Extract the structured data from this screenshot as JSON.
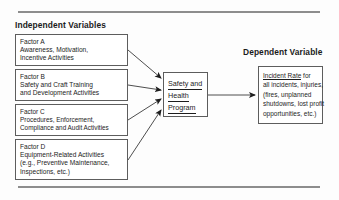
{
  "figure": {
    "headers": {
      "independent": "Independent Variables",
      "dependent": "Dependent Variable"
    },
    "factors": [
      {
        "id": "factor-a",
        "title": "Factor A",
        "line2": "Awareness, Motivation,",
        "line3": "Incentive Activities",
        "line4": ""
      },
      {
        "id": "factor-b",
        "title": "Factor B",
        "line2": "Safety and Craft Training",
        "line3": "and Development Activities",
        "line4": ""
      },
      {
        "id": "factor-c",
        "title": "Factor C",
        "line2": "Procedures, Enforcement,",
        "line3": "Compliance and Audit Activities",
        "line4": ""
      },
      {
        "id": "factor-d",
        "title": "Factor D",
        "line2": "Equipment-Related Activities",
        "line3": "(e.g., Preventive Maintenance,",
        "line4": "Inspections, etc.)"
      }
    ],
    "program": {
      "line1": "Safety and",
      "line2": "Health",
      "line3": "Program"
    },
    "outcome": {
      "emphasis": "Incident Rate",
      "line1_rest": " for",
      "line2": "all incidents, injuries,",
      "line3": "(fires, unplanned",
      "line4": "shutdowns, lost profit",
      "line5": "opportunities, etc.)"
    },
    "colors": {
      "background": "#fdfdfd",
      "box_border": "#5d5d5d",
      "text": "#1d1d1d",
      "rule": "#8d8d8d"
    }
  }
}
